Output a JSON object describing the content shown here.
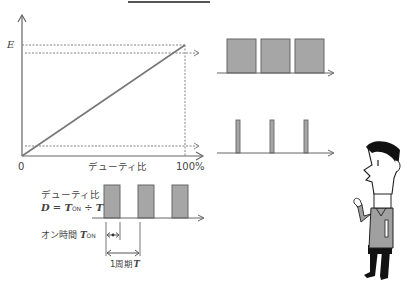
{
  "graph": {
    "y_label": "E",
    "x_origin": "0",
    "x_label": "デューティ比",
    "x_max": "100%"
  },
  "timing": {
    "duty_title": "デューティ比",
    "duty_formula_d": "D",
    "duty_formula_eq": " = ",
    "duty_formula_t": "T",
    "duty_formula_on": "ON",
    "duty_formula_div": " ÷ ",
    "duty_formula_period": "T",
    "on_time_label": "オン時間 ",
    "on_time_symbol": "T",
    "on_time_sub": "ON",
    "period_label": "1周期",
    "period_symbol": "T"
  },
  "waveforms": {
    "high_duty": {
      "pulses": 3,
      "description": "wide pulses (high duty ratio)"
    },
    "low_duty": {
      "pulses": 3,
      "description": "narrow pulses (low duty ratio)"
    }
  },
  "colors": {
    "line": "#555555",
    "pulse_fill": "#a6a6a6",
    "shirt": "#a0a0a0",
    "hair": "#111111"
  }
}
